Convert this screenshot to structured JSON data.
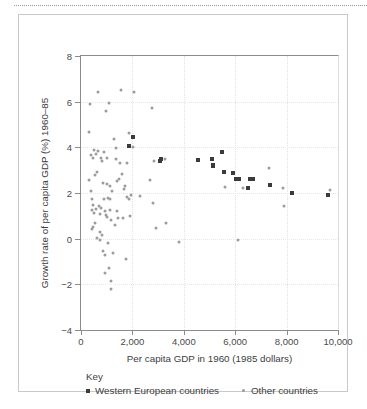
{
  "figure": {
    "top_rule": "dotted-rule"
  },
  "chart_data": {
    "type": "scatter",
    "title": "",
    "xlabel": "Per capita GDP in 1960 (1985 dollars)",
    "ylabel": "Growth rate of per capita GDP (%) 1960–85",
    "xlim": [
      0,
      10000
    ],
    "ylim": [
      -4,
      8
    ],
    "xticks": [
      0,
      2000,
      4000,
      6000,
      8000,
      10000
    ],
    "xtick_labels": [
      "0",
      "2,000",
      "4,000",
      "6,000",
      "8,000",
      "10,000"
    ],
    "yticks": [
      -4,
      -2,
      0,
      2,
      4,
      6,
      8
    ],
    "ytick_labels": [
      "−4",
      "−2",
      "0",
      "2",
      "4",
      "6",
      "8"
    ],
    "grid": true,
    "legend_position": "below-axes",
    "legend_title": "Key",
    "series": [
      {
        "name": "Western European countries",
        "marker": "square",
        "color": "#3b3b3b",
        "points": [
          [
            1870,
            4.05
          ],
          [
            2010,
            4.47
          ],
          [
            2030,
            4.45
          ],
          [
            3080,
            3.42
          ],
          [
            3120,
            3.48
          ],
          [
            4570,
            3.45
          ],
          [
            5080,
            3.47
          ],
          [
            5120,
            3.17
          ],
          [
            5150,
            3.22
          ],
          [
            5480,
            3.78
          ],
          [
            5550,
            2.9
          ],
          [
            5900,
            2.88
          ],
          [
            6050,
            2.62
          ],
          [
            6150,
            2.62
          ],
          [
            6480,
            2.22
          ],
          [
            6560,
            2.6
          ],
          [
            6620,
            2.62
          ],
          [
            6700,
            2.6
          ],
          [
            7350,
            2.33
          ],
          [
            8200,
            1.98
          ],
          [
            9620,
            1.9
          ]
        ]
      },
      {
        "name": "Other countries",
        "marker": "circle",
        "color": "#9c9c9c",
        "points": [
          [
            300,
            4.65
          ],
          [
            330,
            2.55
          ],
          [
            360,
            5.88
          ],
          [
            380,
            2.08
          ],
          [
            400,
            3.65
          ],
          [
            410,
            1.72
          ],
          [
            430,
            1.25
          ],
          [
            440,
            0.42
          ],
          [
            460,
            1.48
          ],
          [
            470,
            0.5
          ],
          [
            480,
            3.55
          ],
          [
            500,
            1.12
          ],
          [
            520,
            3.88
          ],
          [
            540,
            2.8
          ],
          [
            560,
            0.68
          ],
          [
            580,
            3.7
          ],
          [
            600,
            1.3
          ],
          [
            620,
            0.05
          ],
          [
            640,
            2.92
          ],
          [
            660,
            6.42
          ],
          [
            680,
            3.82
          ],
          [
            700,
            1.42
          ],
          [
            720,
            1.1
          ],
          [
            730,
            0.3
          ],
          [
            740,
            -0.08
          ],
          [
            760,
            3.55
          ],
          [
            780,
            1.35
          ],
          [
            800,
            3.4
          ],
          [
            820,
            0.18
          ],
          [
            840,
            -0.55
          ],
          [
            860,
            2.45
          ],
          [
            880,
            3.78
          ],
          [
            900,
            1.75
          ],
          [
            920,
            1.22
          ],
          [
            940,
            -0.72
          ],
          [
            950,
            -1.5
          ],
          [
            960,
            1.05
          ],
          [
            980,
            5.58
          ],
          [
            1000,
            3.52
          ],
          [
            1010,
            2.38
          ],
          [
            1020,
            0.95
          ],
          [
            1040,
            1.78
          ],
          [
            1060,
            -0.2
          ],
          [
            1080,
            -1.28
          ],
          [
            1100,
            5.95
          ],
          [
            1110,
            2.32
          ],
          [
            1120,
            1.72
          ],
          [
            1140,
            1.25
          ],
          [
            1150,
            -1.85
          ],
          [
            1160,
            -2.22
          ],
          [
            1180,
            0.8
          ],
          [
            1200,
            2.1
          ],
          [
            1250,
            -0.62
          ],
          [
            1300,
            4.35
          ],
          [
            1330,
            0.58
          ],
          [
            1350,
            3.98
          ],
          [
            1380,
            3.48
          ],
          [
            1400,
            2.52
          ],
          [
            1420,
            1.2
          ],
          [
            1450,
            0.9
          ],
          [
            1480,
            2.62
          ],
          [
            1520,
            3.3
          ],
          [
            1560,
            6.52
          ],
          [
            1600,
            2.85
          ],
          [
            1640,
            0.92
          ],
          [
            1680,
            2.18
          ],
          [
            1700,
            2.3
          ],
          [
            1740,
            -0.9
          ],
          [
            1780,
            1.82
          ],
          [
            1800,
            3.32
          ],
          [
            1850,
            1.75
          ],
          [
            1880,
            4.62
          ],
          [
            1920,
            0.98
          ],
          [
            1960,
            1.92
          ],
          [
            2020,
            4.02
          ],
          [
            2080,
            6.42
          ],
          [
            2300,
            1.88
          ],
          [
            2700,
            2.58
          ],
          [
            2780,
            5.72
          ],
          [
            2820,
            1.58
          ],
          [
            2850,
            3.38
          ],
          [
            2900,
            0.45
          ],
          [
            3280,
            3.48
          ],
          [
            3320,
            0.68
          ],
          [
            3800,
            -0.15
          ],
          [
            5600,
            2.25
          ],
          [
            6120,
            -0.05
          ],
          [
            6320,
            2.22
          ],
          [
            7300,
            3.08
          ],
          [
            7850,
            2.22
          ],
          [
            7880,
            1.45
          ],
          [
            9700,
            2.12
          ]
        ]
      }
    ]
  }
}
